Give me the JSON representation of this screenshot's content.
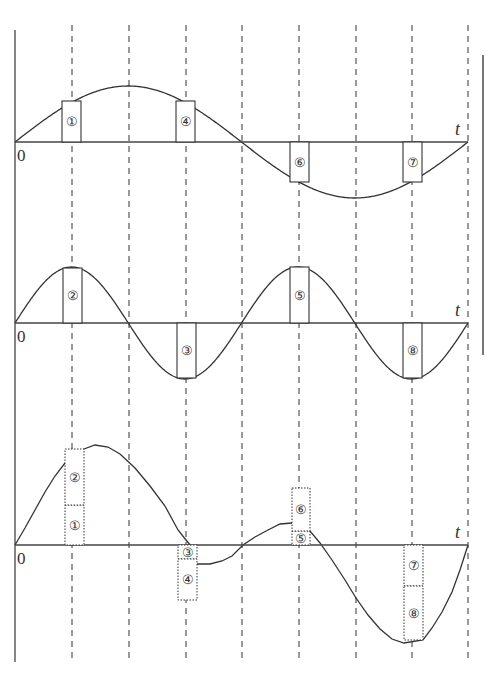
{
  "diagram": {
    "title": "",
    "axis_label": "t",
    "origin_label": "0",
    "colors": {
      "ink": "#333333",
      "background": "#ffffff"
    },
    "left_axis": {
      "x": 15,
      "y1": 30,
      "y2": 662
    },
    "right_edge_bar": {
      "x": 483,
      "y1": 55,
      "y2": 355
    },
    "grid_lines": {
      "x": [
        72,
        129,
        186,
        242,
        299,
        356,
        412,
        468
      ],
      "y1": 25,
      "y2": 662,
      "style": "dashed"
    },
    "panels": [
      {
        "id": "top",
        "name": "Long-period wave (one full cycle)",
        "baseline_y": 142,
        "x_start": 15,
        "x_end": 468,
        "curve": "sine",
        "amplitude": 56,
        "cycles": 1,
        "boxes": [
          {
            "label": "①",
            "x": 62,
            "w": 19,
            "y1": 101,
            "y2": 142,
            "style": "solid"
          },
          {
            "label": "④",
            "x": 176,
            "w": 19,
            "y1": 101,
            "y2": 142,
            "style": "solid"
          },
          {
            "label": "⑥",
            "x": 290,
            "w": 19,
            "y1": 142,
            "y2": 182,
            "style": "solid"
          },
          {
            "label": "⑦",
            "x": 403,
            "w": 19,
            "y1": 142,
            "y2": 182,
            "style": "solid"
          }
        ]
      },
      {
        "id": "middle",
        "name": "Short-period wave (two full cycles)",
        "baseline_y": 323,
        "x_start": 15,
        "x_end": 468,
        "curve": "sine",
        "amplitude": 56,
        "cycles": 2,
        "boxes": [
          {
            "label": "②",
            "x": 63,
            "w": 19,
            "y1": 268,
            "y2": 323,
            "style": "solid"
          },
          {
            "label": "③",
            "x": 177,
            "w": 19,
            "y1": 323,
            "y2": 378,
            "style": "solid"
          },
          {
            "label": "⑤",
            "x": 290,
            "w": 19,
            "y1": 267,
            "y2": 323,
            "style": "solid"
          },
          {
            "label": "⑧",
            "x": 403,
            "w": 19,
            "y1": 323,
            "y2": 378,
            "style": "solid"
          }
        ]
      },
      {
        "id": "bottom",
        "name": "Superposition (sum of top and middle)",
        "baseline_y": 545,
        "x_start": 15,
        "x_end": 468,
        "curve": "sum",
        "boxes": [
          {
            "label": "①",
            "x": 65,
            "w": 19,
            "y1": 505,
            "y2": 545,
            "style": "dotted"
          },
          {
            "label": "②",
            "x": 65,
            "w": 19,
            "y1": 449,
            "y2": 505,
            "style": "dotted"
          },
          {
            "label": "③",
            "x": 178,
            "w": 19,
            "y1": 545,
            "y2": 559,
            "style": "dotted"
          },
          {
            "label": "④",
            "x": 178,
            "w": 19,
            "y1": 559,
            "y2": 600,
            "style": "dotted"
          },
          {
            "label": "⑤",
            "x": 292,
            "w": 18,
            "y1": 531,
            "y2": 545,
            "style": "dotted"
          },
          {
            "label": "⑥",
            "x": 292,
            "w": 18,
            "y1": 488,
            "y2": 531,
            "style": "dotted"
          },
          {
            "label": "⑦",
            "x": 404,
            "w": 19,
            "y1": 545,
            "y2": 586,
            "style": "dotted"
          },
          {
            "label": "⑧",
            "x": 404,
            "w": 19,
            "y1": 586,
            "y2": 640,
            "style": "dotted"
          }
        ],
        "curve_points": [
          [
            15,
            545
          ],
          [
            25,
            528
          ],
          [
            35,
            510
          ],
          [
            45,
            492
          ],
          [
            55,
            476
          ],
          [
            65,
            463
          ],
          [
            84,
            449
          ],
          [
            95,
            445
          ],
          [
            108,
            447
          ],
          [
            120,
            454
          ],
          [
            135,
            468
          ],
          [
            150,
            486
          ],
          [
            165,
            506
          ],
          [
            178,
            530
          ],
          [
            186,
            540
          ],
          [
            196,
            552
          ],
          [
            197,
            564
          ],
          [
            210,
            564
          ],
          [
            222,
            561
          ],
          [
            232,
            556
          ],
          [
            243,
            545
          ],
          [
            255,
            537
          ],
          [
            268,
            530
          ],
          [
            280,
            524
          ],
          [
            292,
            523
          ],
          [
            310,
            531
          ],
          [
            320,
            543
          ],
          [
            332,
            560
          ],
          [
            345,
            580
          ],
          [
            356,
            598
          ],
          [
            368,
            615
          ],
          [
            380,
            629
          ],
          [
            392,
            639
          ],
          [
            404,
            643
          ],
          [
            423,
            640
          ],
          [
            432,
            628
          ],
          [
            442,
            612
          ],
          [
            452,
            592
          ],
          [
            460,
            570
          ],
          [
            468,
            545
          ]
        ]
      }
    ]
  }
}
